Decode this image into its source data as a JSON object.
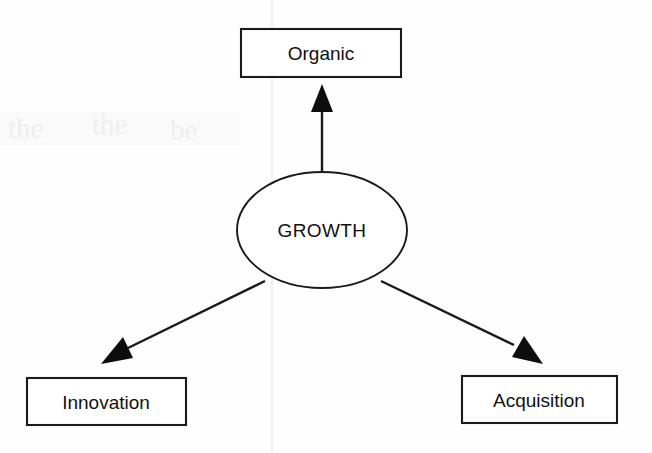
{
  "document": {
    "title": "Growth Diagram",
    "background_color": "#fefefe",
    "ink_color": "#1a1a1a"
  },
  "diagram": {
    "type": "hub-and-spoke",
    "hub": {
      "id": "growth",
      "label": "GROWTH",
      "shape": "ellipse",
      "cx": 322,
      "cy": 230,
      "rx": 85,
      "ry": 58
    },
    "nodes": [
      {
        "id": "organic",
        "label": "Organic",
        "shape": "rectangle",
        "position": "top",
        "x": 241,
        "y": 29,
        "width": 160,
        "height": 48
      },
      {
        "id": "innovation",
        "label": "Innovation",
        "shape": "rectangle",
        "position": "bottom-left",
        "x": 27,
        "y": 378,
        "width": 159,
        "height": 47
      },
      {
        "id": "acquisition",
        "label": "Acquisition",
        "shape": "rectangle",
        "position": "bottom-right",
        "x": 462,
        "y": 376,
        "width": 155,
        "height": 47
      }
    ],
    "edges": [
      {
        "id": "growth-to-organic",
        "from": "growth",
        "to": "organic",
        "arrow": "to",
        "direction": "up"
      },
      {
        "id": "growth-to-innovation",
        "from": "growth",
        "to": "innovation",
        "arrow": "to",
        "direction": "down-left"
      },
      {
        "id": "growth-to-acquisition",
        "from": "growth",
        "to": "acquisition",
        "arrow": "to",
        "direction": "down-right"
      }
    ]
  },
  "artifacts": {
    "fold_line_label": "scan-fold-line",
    "bleed_through_label": "page-bleed-through",
    "ghost_marks": [
      "the",
      "the",
      "be"
    ]
  }
}
